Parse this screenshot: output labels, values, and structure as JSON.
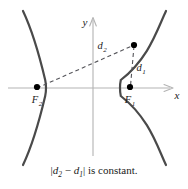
{
  "figure": {
    "kind": "hyperbola-definition-diagram",
    "background_color": "#ffffff"
  },
  "axes": {
    "x_label": "x",
    "y_label": "y",
    "axis_color": "#b3b3b3",
    "origin": {
      "x": 93,
      "y": 88
    },
    "x_axis": {
      "start_x": 8,
      "end_x": 174,
      "y": 88,
      "arrow": "right"
    },
    "y_axis": {
      "x": 93,
      "start_y": 156,
      "end_y": 17,
      "arrow": "up"
    }
  },
  "curve": {
    "name": "hyperbola",
    "color": "#4a4a4a",
    "stroke_width": 2.2,
    "left_vertex": {
      "x": 46,
      "y": 88
    },
    "right_vertex": {
      "x": 120,
      "y": 88
    }
  },
  "points": [
    {
      "id": "focus-2",
      "label": "F",
      "subscript": "2",
      "x": 37,
      "y": 88,
      "label_x": 37,
      "label_y": 103,
      "color": "#000000"
    },
    {
      "id": "focus-1",
      "label": "F",
      "subscript": "1",
      "x": 130,
      "y": 88,
      "label_x": 130,
      "label_y": 103,
      "color": "#000000"
    },
    {
      "id": "point-on-curve",
      "label": "",
      "subscript": "",
      "x": 134,
      "y": 45,
      "color": "#000000"
    }
  ],
  "distances": [
    {
      "id": "d2",
      "label": "d",
      "subscript": "2",
      "from": {
        "x": 37,
        "y": 88
      },
      "to": {
        "x": 134,
        "y": 45
      },
      "label_x": 101,
      "label_y": 48,
      "style": "dashed",
      "color": "#55555a"
    },
    {
      "id": "d1",
      "label": "d",
      "subscript": "1",
      "from": {
        "x": 134,
        "y": 45
      },
      "to": {
        "x": 130,
        "y": 86
      },
      "label_x": 139,
      "label_y": 71,
      "style": "dashed",
      "color": "#55555a"
    }
  ],
  "caption": {
    "prefix_bar": "|",
    "d2": "d",
    "d2_sub": "2",
    "minus": " − ",
    "d1": "d",
    "d1_sub": "1",
    "suffix_bar": "|",
    "tail": " is constant.",
    "full_text": "|d2 − d1| is constant."
  }
}
